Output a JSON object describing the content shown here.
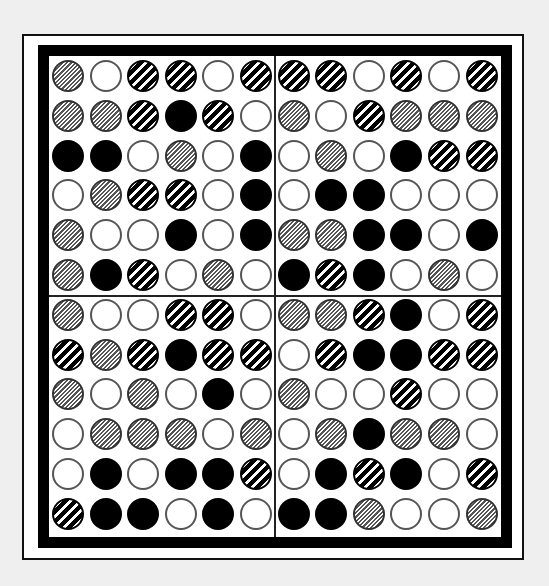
{
  "puzzle": {
    "type": "circle-pattern-grid",
    "rows": 12,
    "cols": 12,
    "quadrants": "2x2 of 6x6",
    "legend": {
      "W": "white-circle",
      "B": "black-circle",
      "H": "fine-hatched-circle",
      "S": "thick-striped-circle"
    },
    "colors": {
      "background": "#efefef",
      "frame": "#000000",
      "board": "#ffffff"
    },
    "grid": [
      [
        "H",
        "W",
        "S",
        "S",
        "W",
        "S",
        "S",
        "S",
        "W",
        "S",
        "W",
        "S"
      ],
      [
        "H",
        "H",
        "S",
        "B",
        "S",
        "W",
        "H",
        "W",
        "S",
        "H",
        "H",
        "H"
      ],
      [
        "B",
        "B",
        "W",
        "H",
        "W",
        "B",
        "W",
        "H",
        "W",
        "B",
        "S",
        "S"
      ],
      [
        "W",
        "H",
        "S",
        "S",
        "W",
        "B",
        "W",
        "B",
        "B",
        "W",
        "W",
        "W"
      ],
      [
        "H",
        "W",
        "W",
        "B",
        "W",
        "B",
        "H",
        "H",
        "B",
        "B",
        "W",
        "B"
      ],
      [
        "H",
        "B",
        "S",
        "W",
        "H",
        "W",
        "B",
        "S",
        "B",
        "W",
        "H",
        "W"
      ],
      [
        "H",
        "W",
        "W",
        "S",
        "S",
        "W",
        "H",
        "H",
        "S",
        "B",
        "W",
        "S"
      ],
      [
        "S",
        "H",
        "S",
        "B",
        "S",
        "S",
        "W",
        "S",
        "B",
        "B",
        "S",
        "S"
      ],
      [
        "H",
        "W",
        "H",
        "W",
        "B",
        "W",
        "H",
        "W",
        "W",
        "S",
        "W",
        "W"
      ],
      [
        "W",
        "H",
        "H",
        "H",
        "W",
        "H",
        "W",
        "H",
        "B",
        "H",
        "H",
        "W"
      ],
      [
        "W",
        "B",
        "W",
        "B",
        "B",
        "S",
        "W",
        "B",
        "S",
        "B",
        "W",
        "S"
      ],
      [
        "S",
        "B",
        "B",
        "W",
        "B",
        "W",
        "B",
        "B",
        "H",
        "W",
        "W",
        "H"
      ]
    ]
  }
}
